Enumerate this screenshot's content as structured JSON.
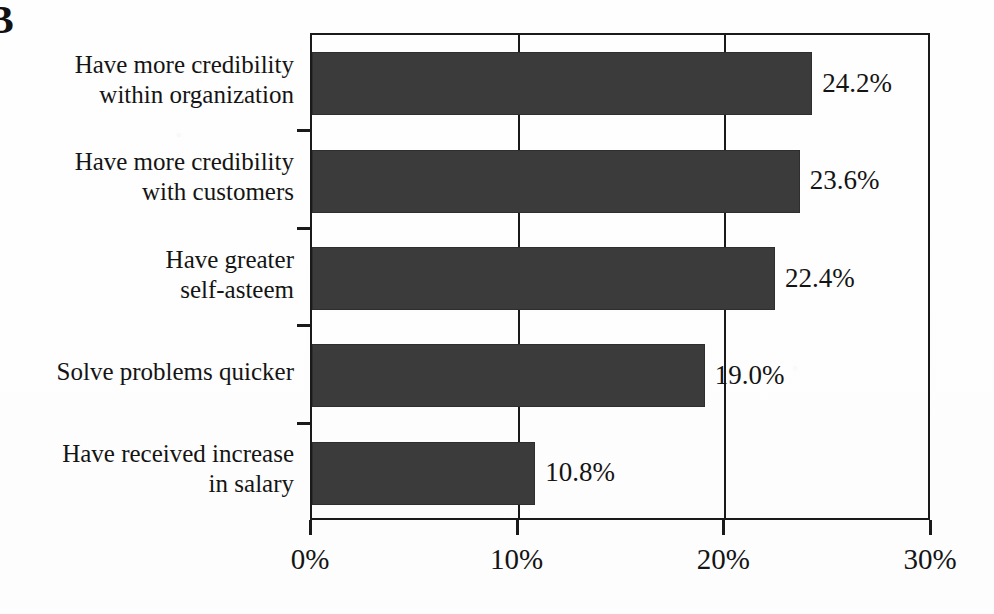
{
  "figure": {
    "letter": "B"
  },
  "chart_data": {
    "type": "bar",
    "orientation": "horizontal",
    "title": "",
    "subtitle": "",
    "xlabel": "",
    "ylabel": "",
    "xlim": [
      0,
      30
    ],
    "xtick_labels": [
      "0%",
      "10%",
      "20%",
      "30%"
    ],
    "xtick_values": [
      0,
      10,
      20,
      30
    ],
    "grid": true,
    "grid_axis": "x",
    "legend": false,
    "bar_color": "#3b3b3b",
    "axis_color": "#1a1a1a",
    "categories": [
      "Have more credibility\nwithin organization",
      "Have more credibility\nwith customers",
      "Have greater\nself-asteem",
      "Solve problems quicker",
      "Have received increase\nin salary"
    ],
    "category_lines": [
      [
        "Have more credibility",
        "within organization"
      ],
      [
        "Have more credibility",
        "with customers"
      ],
      [
        "Have greater",
        "self-asteem"
      ],
      [
        "Solve problems quicker"
      ],
      [
        "Have received increase",
        "in salary"
      ]
    ],
    "values": [
      24.2,
      23.6,
      22.4,
      19.0,
      10.8
    ],
    "data_labels": [
      "24.2%",
      "23.6%",
      "22.4%",
      "19.0%",
      "10.8%"
    ]
  }
}
